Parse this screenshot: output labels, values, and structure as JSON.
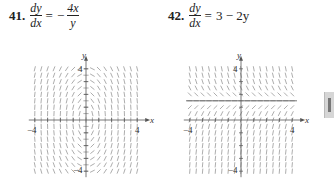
{
  "problems": [
    {
      "number": "41.",
      "lhs_num": "dy",
      "lhs_den": "dx",
      "equals": "=",
      "rhs_sign": "−",
      "rhs_num": "4x",
      "rhs_den": "y",
      "ode": "dy/dx = -4x/y"
    },
    {
      "number": "42.",
      "lhs_num": "dy",
      "lhs_den": "dx",
      "equals": "=",
      "rhs": "3 − 2y",
      "ode": "dy/dx = 3 - 2y"
    }
  ],
  "chart_data": [
    {
      "type": "slope_field",
      "title": "41. dy/dx = -4x/y",
      "xlabel": "x",
      "ylabel": "y",
      "xlim": [
        -4,
        4
      ],
      "ylim": [
        -4,
        4
      ],
      "x_tick_labels": [
        "-4",
        "4"
      ],
      "y_tick_labels": [
        "4",
        "-4"
      ],
      "grid_step": 0.5,
      "grid": false
    },
    {
      "type": "slope_field",
      "title": "42. dy/dx = 3 - 2y",
      "xlabel": "x",
      "ylabel": "y",
      "xlim": [
        -4,
        4
      ],
      "ylim": [
        -4,
        4
      ],
      "x_tick_labels": [
        "-4",
        "4"
      ],
      "y_tick_labels": [
        "4",
        "-4"
      ],
      "grid_step": 0.5,
      "equilibrium_line": 1.5,
      "grid": false
    }
  ],
  "plots": {
    "p1": {
      "x_label": "x",
      "y_label": "y",
      "x_min_label": "−4",
      "x_max_label": "4",
      "y_max_label": "4",
      "y_min_label": "−4"
    },
    "p2": {
      "x_label": "x",
      "y_label": "y",
      "x_min_label": "−4",
      "x_max_label": "4",
      "y_max_label": "4",
      "y_min_label": "−4"
    }
  },
  "colors": {
    "field": "#8a8a8a",
    "axis": "#555555",
    "text": "#222222"
  }
}
